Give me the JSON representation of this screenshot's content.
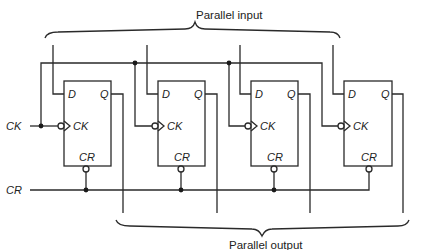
{
  "diagram": {
    "type": "4-bit parallel-in parallel-out register (D flip-flops)",
    "labels": {
      "parallel_input": "Parallel input",
      "parallel_output": "Parallel output",
      "clock_input": "CK",
      "clear_input": "CR"
    },
    "flip_flops": [
      {
        "pin_d": "D",
        "pin_q": "Q",
        "pin_ck": "CK",
        "pin_cr": "CR"
      },
      {
        "pin_d": "D",
        "pin_q": "Q",
        "pin_ck": "CK",
        "pin_cr": "CR"
      },
      {
        "pin_d": "D",
        "pin_q": "Q",
        "pin_ck": "CK",
        "pin_cr": "CR"
      },
      {
        "pin_d": "D",
        "pin_q": "Q",
        "pin_ck": "CK",
        "pin_cr": "CR"
      }
    ],
    "colors": {
      "line": "#2a2a2a",
      "background": "#ffffff"
    }
  }
}
